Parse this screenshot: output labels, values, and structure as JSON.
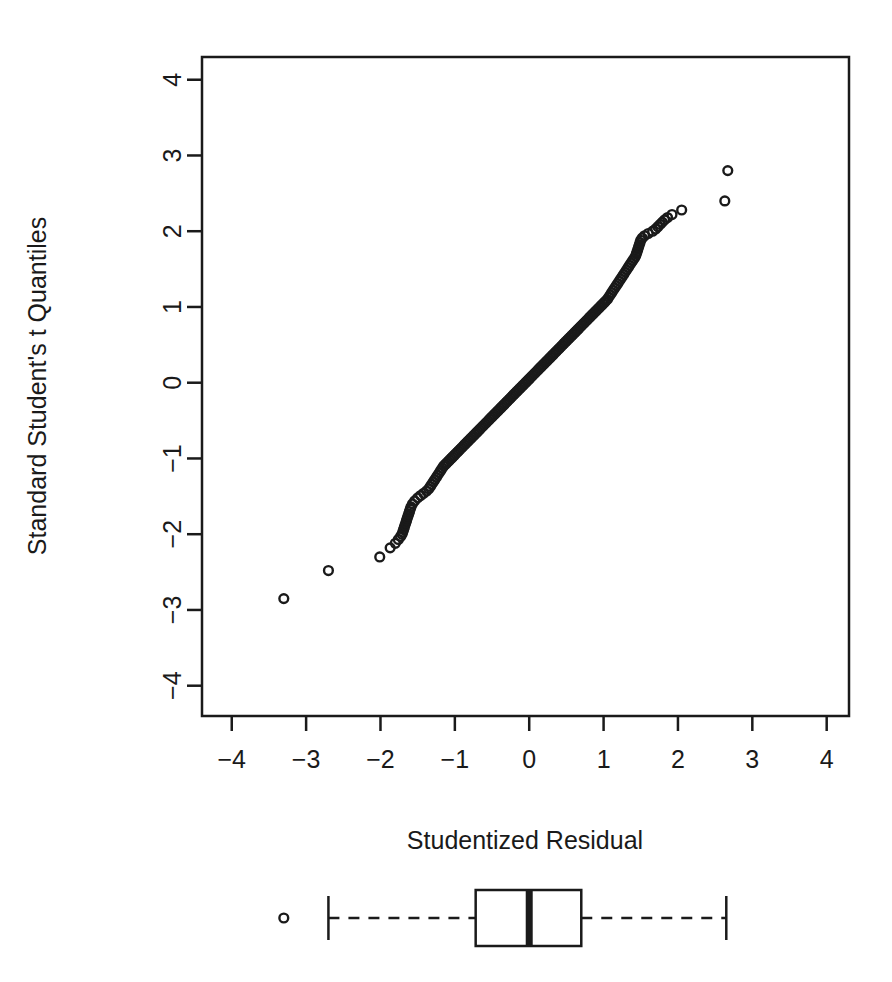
{
  "figure": {
    "background_color": "#ffffff",
    "foreground_color": "#1a1a1a",
    "point_style": "open-circle",
    "point_radius_px": 4.4
  },
  "chart_data": {
    "type": "scatter",
    "title": "",
    "subtitle": "",
    "xlabel": "Studentized Residual",
    "ylabel": "Standard Student's t Quantiles",
    "xlim": [
      -4.4,
      4.3
    ],
    "ylim": [
      -4.4,
      4.3
    ],
    "xticks": [
      -4,
      -3,
      -2,
      -1,
      0,
      1,
      2,
      3,
      4
    ],
    "xticklabels": [
      "-4",
      "-3",
      "-2",
      "-1",
      "0",
      "1",
      "2",
      "3",
      "4"
    ],
    "yticks": [
      -4,
      -3,
      -2,
      -1,
      0,
      1,
      2,
      3,
      4
    ],
    "yticklabels": [
      "-4",
      "-3",
      "-2",
      "-1",
      "0",
      "1",
      "2",
      "3",
      "4"
    ],
    "grid": false,
    "legend": null,
    "frame": "box",
    "x": [
      -3.3,
      -2.7,
      -2.01,
      -1.87,
      -1.8,
      -1.76,
      -1.73,
      -1.71,
      -1.7,
      -1.69,
      -1.68,
      -1.67,
      -1.66,
      -1.65,
      -1.64,
      -1.63,
      -1.62,
      -1.61,
      -1.6,
      -1.59,
      -1.57,
      -1.54,
      -1.5,
      -1.46,
      -1.42,
      -1.38,
      -1.35,
      -1.33,
      -1.31,
      -1.29,
      -1.27,
      -1.25,
      -1.23,
      -1.21,
      -1.19,
      -1.17,
      -1.15,
      -1.13,
      -1.11,
      -1.09,
      -1.07,
      -1.05,
      -1.03,
      -1.01,
      -0.99,
      -0.97,
      -0.95,
      -0.93,
      -0.91,
      -0.89,
      -0.87,
      -0.85,
      -0.83,
      -0.81,
      -0.79,
      -0.77,
      -0.75,
      -0.73,
      -0.71,
      -0.69,
      -0.67,
      -0.65,
      -0.63,
      -0.61,
      -0.59,
      -0.57,
      -0.55,
      -0.53,
      -0.51,
      -0.49,
      -0.47,
      -0.45,
      -0.43,
      -0.41,
      -0.39,
      -0.37,
      -0.35,
      -0.33,
      -0.31,
      -0.29,
      -0.27,
      -0.25,
      -0.23,
      -0.21,
      -0.19,
      -0.17,
      -0.15,
      -0.13,
      -0.11,
      -0.09,
      -0.07,
      -0.05,
      -0.03,
      -0.01,
      0.01,
      0.03,
      0.05,
      0.07,
      0.09,
      0.11,
      0.13,
      0.15,
      0.17,
      0.19,
      0.21,
      0.23,
      0.25,
      0.27,
      0.29,
      0.31,
      0.33,
      0.35,
      0.37,
      0.39,
      0.41,
      0.43,
      0.45,
      0.47,
      0.49,
      0.51,
      0.53,
      0.55,
      0.57,
      0.59,
      0.61,
      0.63,
      0.65,
      0.67,
      0.69,
      0.71,
      0.73,
      0.75,
      0.77,
      0.79,
      0.81,
      0.83,
      0.85,
      0.87,
      0.89,
      0.91,
      0.93,
      0.95,
      0.97,
      0.99,
      1.01,
      1.03,
      1.05,
      1.07,
      1.09,
      1.11,
      1.13,
      1.15,
      1.17,
      1.19,
      1.21,
      1.23,
      1.25,
      1.27,
      1.29,
      1.31,
      1.33,
      1.35,
      1.37,
      1.39,
      1.41,
      1.43,
      1.44,
      1.45,
      1.46,
      1.47,
      1.48,
      1.49,
      1.5,
      1.52,
      1.55,
      1.6,
      1.66,
      1.7,
      1.73,
      1.76,
      1.79,
      1.82,
      1.86,
      1.92,
      2.05,
      2.63,
      2.67
    ],
    "y": [
      -2.85,
      -2.48,
      -2.3,
      -2.18,
      -2.12,
      -2.07,
      -2.03,
      -2.0,
      -1.97,
      -1.94,
      -1.91,
      -1.88,
      -1.85,
      -1.82,
      -1.79,
      -1.76,
      -1.73,
      -1.7,
      -1.67,
      -1.64,
      -1.6,
      -1.56,
      -1.52,
      -1.49,
      -1.46,
      -1.43,
      -1.4,
      -1.37,
      -1.34,
      -1.31,
      -1.28,
      -1.25,
      -1.22,
      -1.19,
      -1.16,
      -1.13,
      -1.1,
      -1.08,
      -1.06,
      -1.04,
      -1.02,
      -1.0,
      -0.98,
      -0.96,
      -0.94,
      -0.92,
      -0.9,
      -0.88,
      -0.86,
      -0.84,
      -0.82,
      -0.8,
      -0.78,
      -0.76,
      -0.74,
      -0.72,
      -0.7,
      -0.68,
      -0.66,
      -0.64,
      -0.62,
      -0.6,
      -0.58,
      -0.56,
      -0.54,
      -0.52,
      -0.5,
      -0.48,
      -0.46,
      -0.44,
      -0.42,
      -0.4,
      -0.38,
      -0.36,
      -0.34,
      -0.32,
      -0.3,
      -0.28,
      -0.26,
      -0.24,
      -0.22,
      -0.2,
      -0.18,
      -0.16,
      -0.14,
      -0.12,
      -0.1,
      -0.08,
      -0.06,
      -0.04,
      -0.02,
      0.0,
      0.02,
      0.04,
      0.06,
      0.08,
      0.1,
      0.12,
      0.14,
      0.16,
      0.18,
      0.2,
      0.22,
      0.24,
      0.26,
      0.28,
      0.3,
      0.32,
      0.34,
      0.36,
      0.38,
      0.4,
      0.42,
      0.44,
      0.46,
      0.48,
      0.5,
      0.52,
      0.54,
      0.56,
      0.58,
      0.6,
      0.62,
      0.64,
      0.66,
      0.68,
      0.7,
      0.72,
      0.74,
      0.76,
      0.78,
      0.8,
      0.82,
      0.84,
      0.86,
      0.88,
      0.9,
      0.92,
      0.94,
      0.96,
      0.98,
      1.0,
      1.02,
      1.04,
      1.06,
      1.08,
      1.1,
      1.13,
      1.16,
      1.19,
      1.22,
      1.25,
      1.28,
      1.31,
      1.34,
      1.37,
      1.4,
      1.43,
      1.46,
      1.49,
      1.52,
      1.55,
      1.58,
      1.61,
      1.64,
      1.67,
      1.7,
      1.73,
      1.76,
      1.79,
      1.82,
      1.85,
      1.88,
      1.91,
      1.94,
      1.97,
      2.0,
      2.03,
      2.06,
      2.09,
      2.12,
      2.15,
      2.18,
      2.22,
      2.28,
      2.4,
      2.8
    ]
  },
  "boxplot": {
    "orientation": "horizontal",
    "whisker_min": -2.7,
    "q1": -0.72,
    "median": 0.0,
    "q3": 0.7,
    "whisker_max": 2.65,
    "outliers": [
      -3.3
    ],
    "whisker_style": "dashed",
    "outlier_style": "open-circle",
    "median_style": "thick-line"
  }
}
